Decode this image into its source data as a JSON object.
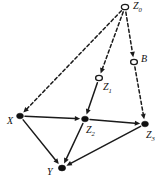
{
  "figure": {
    "kind": "causal-dag",
    "background_color": "#ffffff",
    "ink_color": "#1a1a1a",
    "width": 161,
    "height": 181
  },
  "nodes": [
    {
      "id": "Z0",
      "label": "Z",
      "subscript": "0",
      "style": "open-circle",
      "observed": false,
      "x": 125,
      "y": 7,
      "rx": 3.6,
      "ry": 2.7,
      "label_x": 133,
      "label_y": 7
    },
    {
      "id": "B",
      "label": "B",
      "subscript": "",
      "style": "open-circle",
      "observed": false,
      "x": 134,
      "y": 62,
      "rx": 3.4,
      "ry": 2.6,
      "label_x": 141,
      "label_y": 60
    },
    {
      "id": "Z1",
      "label": "Z",
      "subscript": "1",
      "style": "open-circle",
      "observed": false,
      "x": 99,
      "y": 78,
      "rx": 3.4,
      "ry": 2.6,
      "label_x": 103,
      "label_y": 88
    },
    {
      "id": "X",
      "label": "X",
      "subscript": "",
      "style": "filled-dot",
      "observed": true,
      "x": 20,
      "y": 116,
      "rx": 3.4,
      "ry": 2.8,
      "label_x": 7,
      "label_y": 122
    },
    {
      "id": "Z2",
      "label": "Z",
      "subscript": "2",
      "style": "filled-dot",
      "observed": true,
      "x": 85,
      "y": 119,
      "rx": 3.4,
      "ry": 2.8,
      "label_x": 86,
      "label_y": 131
    },
    {
      "id": "Z3",
      "label": "Z",
      "subscript": "3",
      "style": "filled-dot",
      "observed": true,
      "x": 145,
      "y": 124,
      "rx": 3.4,
      "ry": 2.8,
      "label_x": 146,
      "label_y": 136
    },
    {
      "id": "Y",
      "label": "Y",
      "subscript": "",
      "style": "filled-dot",
      "observed": true,
      "x": 62,
      "y": 168,
      "rx": 3.6,
      "ry": 2.9,
      "label_x": 47,
      "label_y": 173
    }
  ],
  "edges": [
    {
      "from": "Z0",
      "to": "X",
      "style": "dashed",
      "arrow": true
    },
    {
      "from": "Z0",
      "to": "Z1",
      "style": "dashed",
      "arrow": true
    },
    {
      "from": "Z0",
      "to": "B",
      "style": "dashed",
      "arrow": true
    },
    {
      "from": "B",
      "to": "Z3",
      "style": "dashed",
      "arrow": true
    },
    {
      "from": "Z1",
      "to": "Z2",
      "style": "solid",
      "arrow": true
    },
    {
      "from": "X",
      "to": "Z2",
      "style": "solid",
      "arrow": true
    },
    {
      "from": "Z2",
      "to": "Z3",
      "style": "solid",
      "arrow": true
    },
    {
      "from": "X",
      "to": "Y",
      "style": "solid",
      "arrow": true
    },
    {
      "from": "Z2",
      "to": "Y",
      "style": "solid",
      "arrow": true
    },
    {
      "from": "Z3",
      "to": "Y",
      "style": "solid",
      "arrow": true
    }
  ]
}
